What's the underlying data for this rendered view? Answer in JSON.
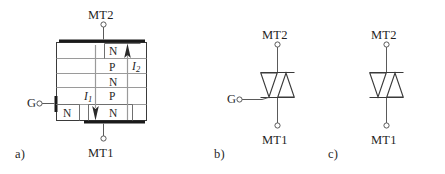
{
  "figure": {
    "title": "",
    "background_color": "#ffffff",
    "line_color": "#3a3a3a",
    "thick_contact_color": "#1a1a1a",
    "text_color": "#1f1f1f",
    "panels": [
      {
        "id": "a",
        "caption": "a)",
        "type": "triac-cross-section",
        "terminals": [
          {
            "name": "MT2",
            "label": "MT2",
            "position": "top"
          },
          {
            "name": "MT1",
            "label": "MT1",
            "position": "bottom"
          },
          {
            "name": "G",
            "label": "G",
            "position": "left"
          }
        ],
        "layers": [
          {
            "label": "N",
            "order": 1
          },
          {
            "label": "P",
            "order": 2
          },
          {
            "label": "N",
            "order": 3
          },
          {
            "label": "P",
            "order": 4
          },
          {
            "label": "N",
            "order": 5
          }
        ],
        "gate_region_label": "N",
        "currents": [
          {
            "name": "I1",
            "label": "I",
            "subscript": "1",
            "direction": "down"
          },
          {
            "name": "I2",
            "label": "I",
            "subscript": "2",
            "direction": "up"
          }
        ]
      },
      {
        "id": "b",
        "caption": "b)",
        "type": "triac-symbol",
        "terminals": [
          {
            "name": "MT2",
            "label": "MT2",
            "position": "top"
          },
          {
            "name": "MT1",
            "label": "MT1",
            "position": "bottom"
          },
          {
            "name": "G",
            "label": "G",
            "position": "left"
          }
        ]
      },
      {
        "id": "c",
        "caption": "c)",
        "type": "diac-symbol",
        "terminals": [
          {
            "name": "MT2",
            "label": "MT2",
            "position": "top"
          },
          {
            "name": "MT1",
            "label": "MT1",
            "position": "bottom"
          }
        ]
      }
    ]
  }
}
